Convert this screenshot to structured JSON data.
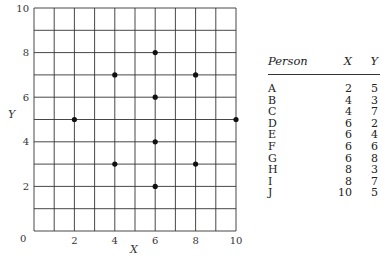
{
  "chart_data": {
    "type": "scatter",
    "title": "",
    "xlabel": "X",
    "ylabel": "Y",
    "xlim": [
      0,
      10
    ],
    "ylim": [
      0,
      10
    ],
    "grid": true,
    "x_ticks": [
      0,
      2,
      4,
      6,
      8,
      10
    ],
    "y_ticks": [
      2,
      4,
      6,
      8,
      10
    ],
    "points": [
      {
        "label": "A",
        "x": 2,
        "y": 5
      },
      {
        "label": "B",
        "x": 4,
        "y": 3
      },
      {
        "label": "C",
        "x": 4,
        "y": 7
      },
      {
        "label": "D",
        "x": 6,
        "y": 2
      },
      {
        "label": "E",
        "x": 6,
        "y": 4
      },
      {
        "label": "F",
        "x": 6,
        "y": 6
      },
      {
        "label": "G",
        "x": 6,
        "y": 8
      },
      {
        "label": "H",
        "x": 8,
        "y": 3
      },
      {
        "label": "I",
        "x": 8,
        "y": 7
      },
      {
        "label": "J",
        "x": 10,
        "y": 5
      }
    ]
  },
  "table": {
    "headers": [
      "Person",
      "X",
      "Y"
    ],
    "rows": [
      [
        "A",
        "2",
        "5"
      ],
      [
        "B",
        "4",
        "3"
      ],
      [
        "C",
        "4",
        "7"
      ],
      [
        "D",
        "6",
        "2"
      ],
      [
        "E",
        "6",
        "4"
      ],
      [
        "F",
        "6",
        "6"
      ],
      [
        "G",
        "6",
        "8"
      ],
      [
        "H",
        "8",
        "3"
      ],
      [
        "I",
        "8",
        "7"
      ],
      [
        "J",
        "10",
        "5"
      ]
    ]
  },
  "axis": {
    "origin_label": "0",
    "x_label": "X",
    "y_label": "Y"
  }
}
